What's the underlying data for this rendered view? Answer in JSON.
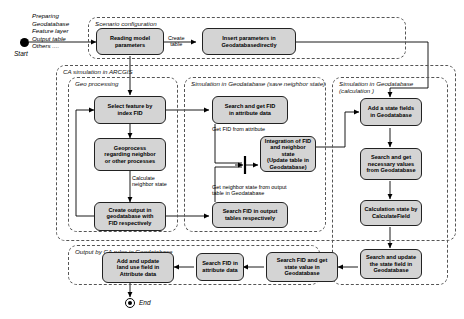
{
  "diagram": {
    "start": {
      "label": "Start",
      "preparing_note": "Preparing\nGeodatabase\nFeature layer\nOutput table\nOthers ...."
    },
    "end": {
      "label": "End"
    },
    "groups": [
      {
        "id": "scenario",
        "title": "Scenario configuration"
      },
      {
        "id": "ca",
        "title": "CA simulation in ARCGIS"
      },
      {
        "id": "geo",
        "title": "Geo processing"
      },
      {
        "id": "savestate",
        "title": "Simulation in Geodatabase (save neighbor state)"
      },
      {
        "id": "calc",
        "title": "Simulation in Geodatabase (calculation )"
      },
      {
        "id": "output",
        "title": "Output by CA rules in Geodatabase"
      }
    ],
    "nodes": [
      {
        "id": "reading",
        "lines": [
          "Reading model",
          "parameters"
        ]
      },
      {
        "id": "insert",
        "lines": [
          "Insert parameters in",
          "Geodatabasedirectly"
        ]
      },
      {
        "id": "selectfid",
        "lines": [
          "Select feature by",
          "index FID"
        ]
      },
      {
        "id": "geoprocess",
        "lines": [
          "Geoprocess",
          "regarding neighbor",
          "or other processes"
        ]
      },
      {
        "id": "createout",
        "lines": [
          "Create output in",
          "geodatabase with",
          "FID respectively"
        ]
      },
      {
        "id": "searchattr",
        "lines": [
          "Search and get FID",
          "in attribute data"
        ]
      },
      {
        "id": "searchout",
        "lines": [
          "Search FID in output",
          "tables respectively"
        ]
      },
      {
        "id": "integration",
        "lines": [
          "Integration of FID",
          "and neighbor state",
          "(Update table in",
          "Geodatabase)"
        ]
      },
      {
        "id": "addstate",
        "lines": [
          "Add a state fields",
          "in Geodatabase"
        ]
      },
      {
        "id": "searchnec",
        "lines": [
          "Search and get",
          "necessary values",
          "from Geodatabase"
        ]
      },
      {
        "id": "calcstate",
        "lines": [
          "Calculation state by",
          "CalculateField"
        ]
      },
      {
        "id": "searchupd",
        "lines": [
          "Search and update",
          "the state field in",
          "Geodatabase"
        ]
      },
      {
        "id": "searchgetval",
        "lines": [
          "Search FID and get",
          "state value in",
          "Geodatabase"
        ]
      },
      {
        "id": "searchfid",
        "lines": [
          "Search FID in",
          "attribute data"
        ]
      },
      {
        "id": "addupdate",
        "lines": [
          "Add and update",
          "land use field in",
          "Attribute data"
        ]
      }
    ],
    "edge_labels": [
      {
        "id": "create_table",
        "lines": [
          "Create",
          "table"
        ]
      },
      {
        "id": "calc_neighbor",
        "lines": [
          "Calculate",
          "neighbor state"
        ]
      },
      {
        "id": "get_fid_attr",
        "lines": [
          "Get FID from attribute"
        ]
      },
      {
        "id": "get_neighbor",
        "lines": [
          "Get neighbor state from output",
          "table in Geodatabase"
        ]
      }
    ],
    "colors": {
      "box_fill": "#d4d4d4",
      "box_stroke": "#222222",
      "group_stroke": "#555555",
      "line": "#000000",
      "background": "#ffffff"
    }
  }
}
